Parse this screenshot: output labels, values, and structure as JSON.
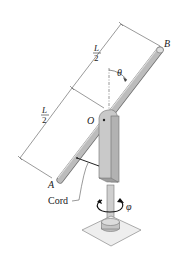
{
  "figure": {
    "labels": {
      "point_B": "B",
      "point_A": "A",
      "point_O": "O",
      "angle_theta": "θ",
      "angle_phi": "φ",
      "cord": "Cord",
      "half_length_top_num": "L",
      "half_length_top_den": "2",
      "half_length_bottom_num": "L",
      "half_length_bottom_den": "2"
    },
    "colors": {
      "rod_fill": "#b9b9b9",
      "rod_edge": "#6f6f6f",
      "bracket_fill": "#c8c8c8",
      "line": "#333333",
      "base_plate": "#eeeeee"
    }
  }
}
